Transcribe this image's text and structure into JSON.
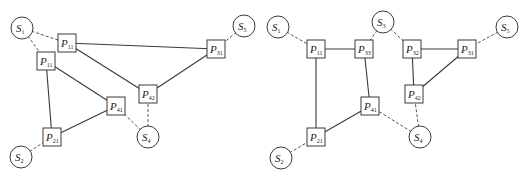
{
  "diagrams": [
    {
      "id": "left",
      "sources": [
        {
          "key": "S1",
          "letter": "S",
          "sub": "1"
        },
        {
          "key": "S5",
          "letter": "S",
          "sub": "5"
        },
        {
          "key": "S4",
          "letter": "S",
          "sub": "4"
        },
        {
          "key": "S2",
          "letter": "S",
          "sub": "2"
        }
      ],
      "processors": [
        {
          "key": "P11a",
          "letter": "P",
          "sub": "11"
        },
        {
          "key": "P11b",
          "letter": "P",
          "sub": "11"
        },
        {
          "key": "P31",
          "letter": "P",
          "sub": "31"
        },
        {
          "key": "P42",
          "letter": "P",
          "sub": "42"
        },
        {
          "key": "P41",
          "letter": "P",
          "sub": "41"
        },
        {
          "key": "P21",
          "letter": "P",
          "sub": "21"
        }
      ],
      "solid_edges": [
        [
          "P11a",
          "P31"
        ],
        [
          "P11a",
          "P42"
        ],
        [
          "P42",
          "P31"
        ],
        [
          "P11b",
          "P41"
        ],
        [
          "P11b",
          "P21"
        ],
        [
          "P21",
          "P41"
        ]
      ],
      "dashed_edges": [
        [
          "S1",
          "P11a"
        ],
        [
          "S1",
          "P11b"
        ],
        [
          "S5",
          "P31"
        ],
        [
          "S4",
          "P42"
        ],
        [
          "S4",
          "P41"
        ],
        [
          "S2",
          "P21"
        ]
      ]
    },
    {
      "id": "right",
      "sources": [
        {
          "key": "S1",
          "letter": "S",
          "sub": "1"
        },
        {
          "key": "S3",
          "letter": "S",
          "sub": "3"
        },
        {
          "key": "S5",
          "letter": "S",
          "sub": "5"
        },
        {
          "key": "S4",
          "letter": "S",
          "sub": "4"
        },
        {
          "key": "S2",
          "letter": "S",
          "sub": "2"
        }
      ],
      "processors": [
        {
          "key": "P11",
          "letter": "P",
          "sub": "11"
        },
        {
          "key": "P33",
          "letter": "P",
          "sub": "33"
        },
        {
          "key": "P32",
          "letter": "P",
          "sub": "32"
        },
        {
          "key": "P31",
          "letter": "P",
          "sub": "31"
        },
        {
          "key": "P42",
          "letter": "P",
          "sub": "42"
        },
        {
          "key": "P41",
          "letter": "P",
          "sub": "41"
        },
        {
          "key": "P21",
          "letter": "P",
          "sub": "21"
        }
      ],
      "solid_edges": [
        [
          "P11",
          "P33"
        ],
        [
          "P11",
          "P21"
        ],
        [
          "P33",
          "P41"
        ],
        [
          "P21",
          "P41"
        ],
        [
          "P32",
          "P31"
        ],
        [
          "P32",
          "P42"
        ],
        [
          "P42",
          "P31"
        ]
      ],
      "dashed_edges": [
        [
          "S1",
          "P11"
        ],
        [
          "S3",
          "P33"
        ],
        [
          "S3",
          "P32"
        ],
        [
          "S5",
          "P31"
        ],
        [
          "S4",
          "P41"
        ],
        [
          "S4",
          "P42"
        ],
        [
          "S2",
          "P21"
        ]
      ]
    }
  ]
}
